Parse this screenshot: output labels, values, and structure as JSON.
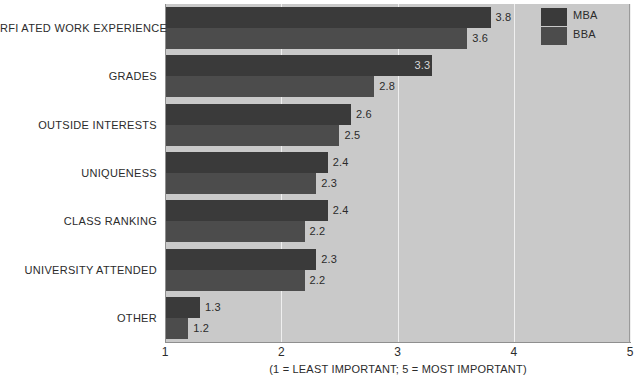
{
  "chart_data": {
    "type": "bar",
    "orientation": "horizontal",
    "title": "",
    "xlabel": "(1 = LEAST IMPORTANT; 5 = MOST IMPORTANT)",
    "ylabel": "",
    "xlim": [
      1,
      5
    ],
    "xticks": [
      "1",
      "2",
      "3",
      "4",
      "5"
    ],
    "grid": true,
    "legend_position": "top-right",
    "categories": [
      "RFI ATED WORK EXPERIENCE",
      "GRADES",
      "OUTSIDE INTERESTS",
      "UNIQUENESS",
      "CLASS RANKING",
      "UNIVERSITY ATTENDED",
      "OTHER"
    ],
    "series": [
      {
        "name": "MBA",
        "color": "#3a3a3a",
        "values": [
          3.8,
          3.3,
          2.6,
          2.4,
          2.4,
          2.3,
          1.3
        ],
        "labels": [
          "3.8",
          "3.3",
          "2.6",
          "2.4",
          "2.4",
          "2.3",
          "1.3"
        ]
      },
      {
        "name": "BBA",
        "color": "#4c4c4c",
        "values": [
          3.6,
          2.8,
          2.5,
          2.3,
          2.2,
          2.2,
          1.2
        ],
        "labels": [
          "3.6",
          "2.8",
          "2.5",
          "2.3",
          "2.2",
          "2.2",
          "1.2"
        ]
      }
    ]
  },
  "legend": {
    "entries": [
      {
        "label": "MBA",
        "color": "#3a3a3a"
      },
      {
        "label": "BBA",
        "color": "#4c4c4c"
      }
    ]
  },
  "axis": {
    "caption": "(1 = LEAST IMPORTANT; 5 = MOST IMPORTANT)",
    "ticks": [
      "1",
      "2",
      "3",
      "4",
      "5"
    ]
  },
  "colors": {
    "plot_background": "#c9c9c9",
    "gridline": "#efefef",
    "axis_line": "#8f8f8f",
    "text": "#2b2b2b",
    "mba_bar": "#3a3a3a",
    "bba_bar": "#4c4c4c"
  }
}
